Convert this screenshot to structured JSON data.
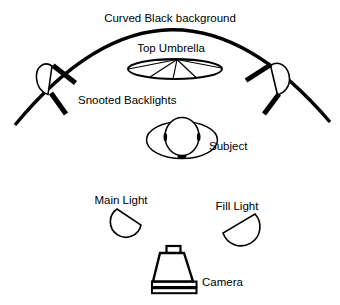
{
  "diagram": {
    "type": "studio-lighting-setup",
    "labels": {
      "curved_background": "Curved Black background",
      "top_umbrella": "Top Umbrella",
      "snooted_backlights": "Snooted Backlights",
      "subject": "Subject",
      "main_light": "Main Light",
      "fill_light": "Fill Light",
      "camera": "Camera"
    },
    "colors": {
      "ink": "#000000",
      "background": "#ffffff"
    }
  }
}
